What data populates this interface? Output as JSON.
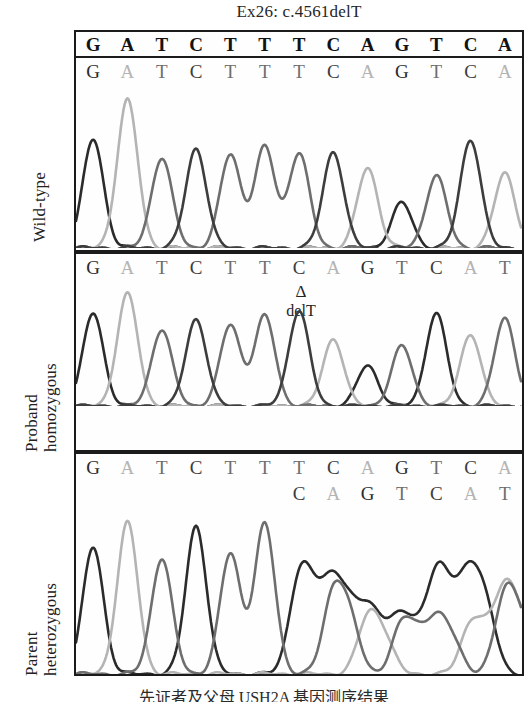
{
  "figure": {
    "title": "Ex26: c.4561delT",
    "caption": "先证者及父母 USH2A 基因测序结果"
  },
  "colors": {
    "base_G": "#2b2b2b",
    "base_A": "#b4b4b4",
    "base_T": "#6e6e6e",
    "base_C": "#3d3d3d",
    "frame": "#1b1b1b",
    "background": "#ffffff"
  },
  "panels": [
    {
      "id": "wild-type",
      "label_lines": [
        "Wild-type"
      ],
      "header_sequence": [
        "G",
        "A",
        "T",
        "C",
        "T",
        "T",
        "T",
        "C",
        "A",
        "G",
        "T",
        "C",
        "A"
      ],
      "called_sequence": [
        "G",
        "A",
        "T",
        "C",
        "T",
        "T",
        "T",
        "C",
        "A",
        "G",
        "T",
        "C",
        "A"
      ],
      "second_sequence": [],
      "annotation": null,
      "chart_data": {
        "type": "line",
        "title": "Wild-type Sanger chromatogram",
        "xlabel": "",
        "ylabel": "Fluorescence intensity",
        "ylim": [
          0,
          100
        ],
        "grid": false,
        "legend": "none",
        "x": [
          1,
          2,
          3,
          4,
          5,
          6,
          7,
          8,
          9,
          10,
          11,
          12,
          13
        ],
        "categories": [
          "G",
          "A",
          "T",
          "C",
          "T",
          "T",
          "T",
          "C",
          "A",
          "G",
          "T",
          "C",
          "A"
        ],
        "values": [
          72,
          98,
          60,
          66,
          62,
          67,
          63,
          64,
          53,
          30,
          48,
          72,
          50
        ],
        "series": [
          {
            "name": "G trace",
            "color": "#2b2b2b",
            "values": [
              72,
              0,
              0,
              0,
              0,
              0,
              0,
              0,
              0,
              30,
              0,
              0,
              0
            ]
          },
          {
            "name": "A trace",
            "color": "#b4b4b4",
            "values": [
              0,
              98,
              0,
              0,
              0,
              0,
              0,
              0,
              53,
              0,
              0,
              0,
              50
            ]
          },
          {
            "name": "T trace",
            "color": "#6e6e6e",
            "values": [
              0,
              0,
              60,
              0,
              62,
              67,
              63,
              0,
              0,
              0,
              48,
              0,
              0
            ]
          },
          {
            "name": "C trace",
            "color": "#3d3d3d",
            "values": [
              0,
              0,
              0,
              66,
              0,
              0,
              0,
              64,
              0,
              0,
              0,
              72,
              0
            ]
          }
        ]
      }
    },
    {
      "id": "proband-homozygous",
      "label_lines": [
        "Proband",
        "homozygous"
      ],
      "header_sequence": [],
      "called_sequence": [
        "G",
        "A",
        "T",
        "C",
        "T",
        "T",
        "C",
        "A",
        "G",
        "T",
        "C",
        "A",
        "T"
      ],
      "second_sequence": [],
      "annotation": {
        "symbol": "Δ",
        "text": "delT",
        "at_index": 6
      },
      "chart_data": {
        "type": "line",
        "title": "Proband homozygous chromatogram (c.4561delT)",
        "xlabel": "",
        "ylabel": "Fluorescence intensity",
        "ylim": [
          0,
          100
        ],
        "grid": false,
        "legend": "none",
        "x": [
          1,
          2,
          3,
          4,
          5,
          6,
          7,
          8,
          9,
          10,
          11,
          12,
          13
        ],
        "categories": [
          "G",
          "A",
          "T",
          "C",
          "T",
          "T",
          "C",
          "A",
          "G",
          "T",
          "C",
          "A",
          "T"
        ],
        "values": [
          80,
          97,
          66,
          75,
          70,
          78,
          82,
          58,
          35,
          52,
          80,
          62,
          76
        ],
        "series": [
          {
            "name": "G trace",
            "color": "#2b2b2b",
            "values": [
              80,
              0,
              0,
              0,
              0,
              0,
              0,
              0,
              35,
              0,
              80,
              0,
              0
            ]
          },
          {
            "name": "A trace",
            "color": "#b4b4b4",
            "values": [
              0,
              97,
              0,
              0,
              0,
              0,
              0,
              58,
              0,
              0,
              0,
              62,
              0
            ]
          },
          {
            "name": "T trace",
            "color": "#6e6e6e",
            "values": [
              0,
              0,
              66,
              0,
              70,
              78,
              0,
              0,
              0,
              52,
              0,
              0,
              76
            ]
          },
          {
            "name": "C trace",
            "color": "#3d3d3d",
            "values": [
              0,
              0,
              0,
              75,
              0,
              0,
              82,
              0,
              0,
              0,
              0,
              0,
              0
            ]
          }
        ]
      }
    },
    {
      "id": "parent-heterozygous",
      "label_lines": [
        "Parent",
        "heterozygous"
      ],
      "header_sequence": [],
      "called_sequence": [
        "G",
        "A",
        "T",
        "C",
        "T",
        "T",
        "T",
        "C",
        "A",
        "G",
        "T",
        "C",
        "A"
      ],
      "second_sequence": [
        "C",
        "A",
        "G",
        "T",
        "C",
        "A",
        "T"
      ],
      "annotation": null,
      "chart_data": {
        "type": "line",
        "title": "Parent heterozygous chromatogram (overlapping traces after deletion)",
        "xlabel": "",
        "ylabel": "Fluorescence intensity",
        "ylim": [
          0,
          100
        ],
        "grid": false,
        "legend": "none",
        "x": [
          1,
          2,
          3,
          4,
          5,
          6,
          7,
          8,
          9,
          10,
          11,
          12,
          13
        ],
        "categories": [
          "G",
          "A",
          "T",
          "C",
          "T",
          "T",
          "T",
          "C",
          "A",
          "G",
          "T",
          "C",
          "A"
        ],
        "values": [
          82,
          98,
          75,
          96,
          78,
          97,
          58,
          50,
          34,
          30,
          56,
          56,
          48
        ],
        "series": [
          {
            "name": "G trace",
            "color": "#2b2b2b",
            "values": [
              82,
              0,
              0,
              96,
              0,
              0,
              58,
              50,
              34,
              30,
              56,
              56,
              0
            ]
          },
          {
            "name": "A trace",
            "color": "#b4b4b4",
            "values": [
              0,
              98,
              0,
              0,
              0,
              0,
              0,
              0,
              34,
              0,
              0,
              30,
              48
            ]
          },
          {
            "name": "T trace",
            "color": "#6e6e6e",
            "values": [
              0,
              0,
              75,
              0,
              78,
              97,
              0,
              50,
              0,
              30,
              30,
              0,
              48
            ]
          },
          {
            "name": "C trace",
            "color": "#3d3d3d",
            "values": [
              0,
              0,
              0,
              0,
              0,
              0,
              0,
              0,
              0,
              0,
              0,
              0,
              0
            ]
          }
        ]
      }
    }
  ]
}
